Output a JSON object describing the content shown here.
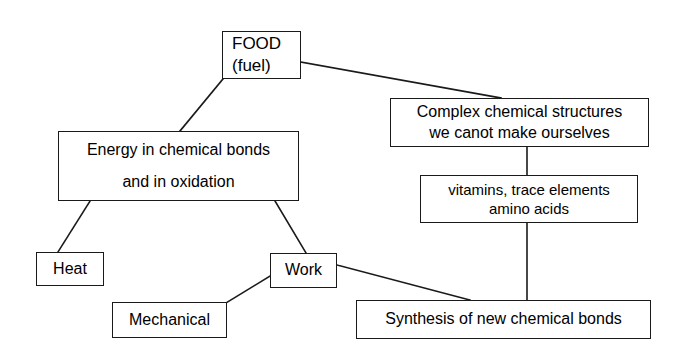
{
  "diagram": {
    "type": "flowchart",
    "title": "",
    "canvas": {
      "width": 675,
      "height": 355,
      "background": "#ffffff"
    },
    "style": {
      "stroke": "#1a1a1a",
      "text": "#000000",
      "box_fill": "#ffffff"
    },
    "nodes": {
      "food": {
        "line1": "FOOD",
        "line2": "(fuel)"
      },
      "complex": {
        "line1": "Complex chemical structures",
        "line2": "we canot make ourselves"
      },
      "vitamins": {
        "line1": "vitamins, trace elements",
        "line2": "amino acids"
      },
      "energy": {
        "line1": "Energy in chemical bonds",
        "line2": "and in oxidation"
      },
      "heat": {
        "line1": "Heat"
      },
      "work": {
        "line1": "Work"
      },
      "mechanical": {
        "line1": "Mechanical"
      },
      "synthesis": {
        "line1": "Synthesis of new chemical bonds"
      }
    },
    "edges": [
      {
        "from": "food",
        "to": "energy",
        "kind": "diagonal"
      },
      {
        "from": "food",
        "to": "complex",
        "kind": "diagonal"
      },
      {
        "from": "complex",
        "to": "vitamins",
        "kind": "vertical"
      },
      {
        "from": "vitamins",
        "to": "synthesis",
        "kind": "vertical"
      },
      {
        "from": "energy",
        "to": "heat",
        "kind": "diagonal"
      },
      {
        "from": "energy",
        "to": "work",
        "kind": "diagonal"
      },
      {
        "from": "work",
        "to": "mechanical",
        "kind": "diagonal"
      },
      {
        "from": "work",
        "to": "synthesis",
        "kind": "diagonal"
      }
    ]
  }
}
